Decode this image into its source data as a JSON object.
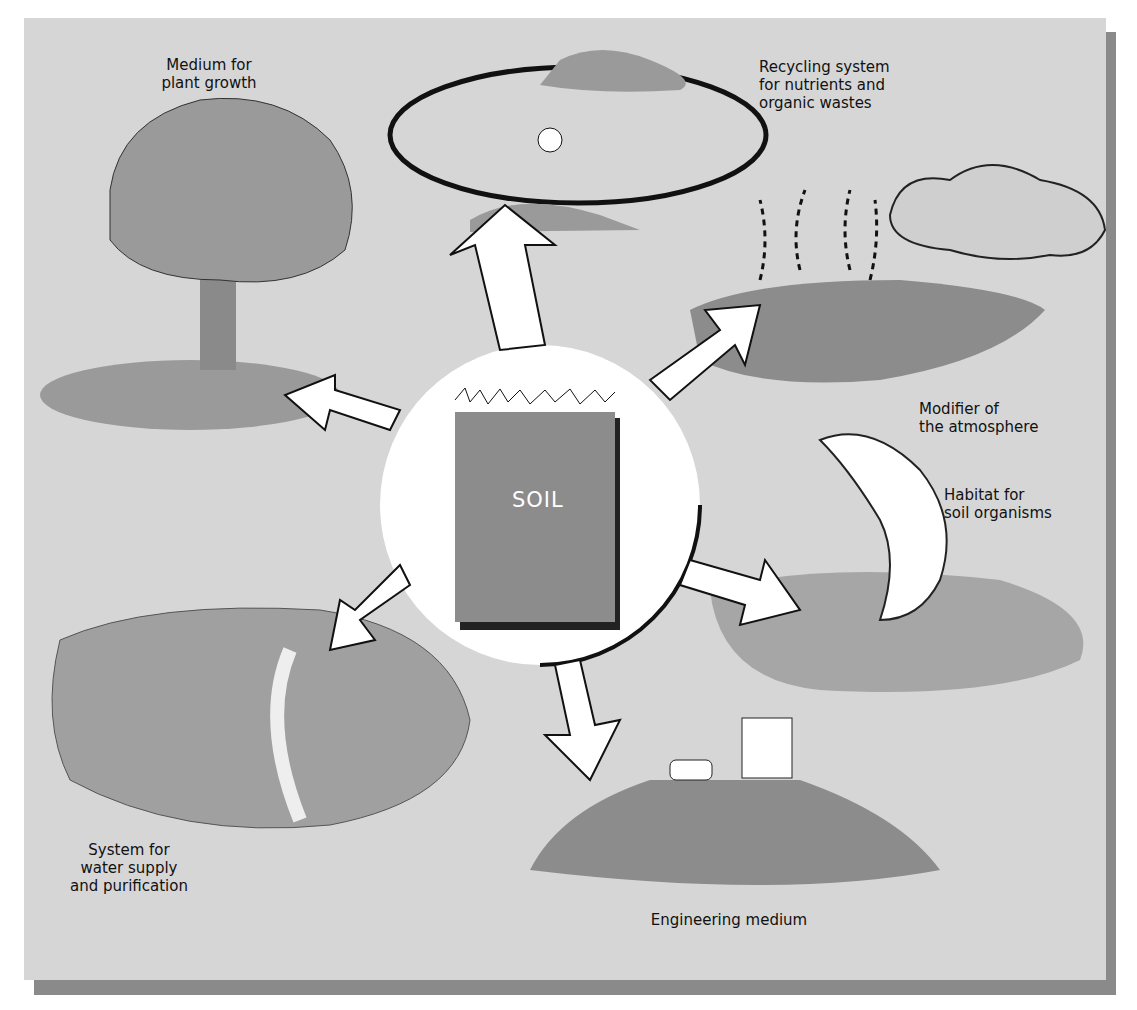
{
  "diagram": {
    "center": {
      "label": "SOIL"
    },
    "functions": [
      {
        "id": "plant-growth",
        "label": "Medium for\nplant growth"
      },
      {
        "id": "recycling",
        "label": "Recycling system\nfor nutrients and\norganic wastes"
      },
      {
        "id": "atmosphere",
        "label": "Modifier of\nthe atmosphere"
      },
      {
        "id": "habitat",
        "label": "Habitat for\nsoil organisms"
      },
      {
        "id": "engineering",
        "label": "Engineering medium"
      },
      {
        "id": "water",
        "label": "System for\nwater supply\nand purification"
      }
    ]
  },
  "colors": {
    "background": "#d6d6d6",
    "soil_box": "#8c8c8c",
    "arrow_fill": "#ffffff",
    "ink": "#111111",
    "shadow": "#8a8a8a"
  }
}
